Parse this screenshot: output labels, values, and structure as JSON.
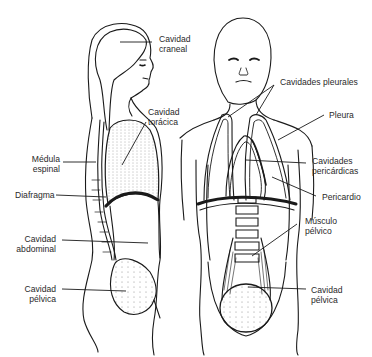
{
  "diagram": {
    "title": "",
    "colors": {
      "ink": "#1a1a1a",
      "label": "#2a2a2a",
      "background": "#ffffff"
    },
    "figures": [
      {
        "id": "lateral",
        "view": "side"
      },
      {
        "id": "frontal",
        "view": "front"
      }
    ],
    "labels": {
      "cavidad_craneal": {
        "line1": "Cavidad",
        "line2": "craneal"
      },
      "cavidad_toracica": {
        "line1": "Cavidad",
        "line2": "torácica"
      },
      "medula_espinal": {
        "line1": "Médula",
        "line2": "espinal"
      },
      "diafragma": {
        "line1": "Diafragma"
      },
      "cavidad_abdominal": {
        "line1": "Cavidad",
        "line2": "abdominal"
      },
      "cavidad_pelvica_left": {
        "line1": "Cavidad",
        "line2": "pélvica"
      },
      "cavidades_pleurales": {
        "line1": "Cavidades pleurales"
      },
      "pleura": {
        "line1": "Pleura"
      },
      "cavidades_pericardicas": {
        "line1": "Cavidades",
        "line2": "pericárdicas"
      },
      "pericardio": {
        "line1": "Pericardio"
      },
      "musculo_pelvico": {
        "line1": "Músculo",
        "line2": "pélvico"
      },
      "cavidad_pelvica_right": {
        "line1": "Cavidad",
        "line2": "pélvica"
      }
    }
  }
}
